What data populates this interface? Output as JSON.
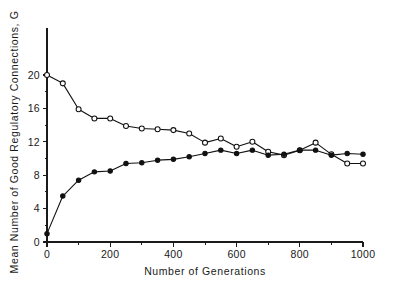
{
  "chart_data": {
    "type": "line",
    "title": "",
    "xlabel": "Number of Generations",
    "ylabel": "Mean Number of Good Regulatory Connections, G",
    "xlim": [
      0,
      1000
    ],
    "ylim": [
      0,
      22
    ],
    "xticks": [
      0,
      200,
      400,
      600,
      800,
      1000
    ],
    "xtick_labels": [
      "0",
      "200",
      "400",
      "600",
      "800",
      "1000"
    ],
    "xminor_ticks": [
      100,
      300,
      500,
      700,
      900
    ],
    "yticks": [
      0,
      4,
      8,
      12,
      16,
      20
    ],
    "ytick_labels": [
      "0",
      "4",
      "8",
      "12",
      "16",
      "20"
    ],
    "yminor_ticks": [
      2,
      6,
      10,
      14,
      18
    ],
    "grid": false,
    "legend": "none",
    "series": [
      {
        "name": "declining-series",
        "marker": "open-circle",
        "x": [
          0,
          50,
          100,
          150,
          200,
          250,
          300,
          350,
          400,
          450,
          500,
          550,
          600,
          650,
          700,
          750,
          800,
          850,
          900,
          950,
          1000
        ],
        "values": [
          20.0,
          19.0,
          15.9,
          14.8,
          14.8,
          13.9,
          13.6,
          13.5,
          13.4,
          13.0,
          11.9,
          12.4,
          11.4,
          12.0,
          10.8,
          10.4,
          11.0,
          11.9,
          10.5,
          9.4,
          9.4
        ]
      },
      {
        "name": "rising-series",
        "marker": "filled-circle",
        "x": [
          0,
          50,
          100,
          150,
          200,
          250,
          300,
          350,
          400,
          450,
          500,
          550,
          600,
          650,
          700,
          750,
          800,
          850,
          900,
          950,
          1000
        ],
        "values": [
          1.0,
          5.5,
          7.4,
          8.4,
          8.5,
          9.4,
          9.5,
          9.8,
          9.9,
          10.2,
          10.6,
          11.0,
          10.6,
          11.0,
          10.4,
          10.5,
          11.0,
          11.0,
          10.4,
          10.6,
          10.5
        ]
      }
    ]
  },
  "colors": {
    "ink": "#111111",
    "background": "#ffffff"
  }
}
